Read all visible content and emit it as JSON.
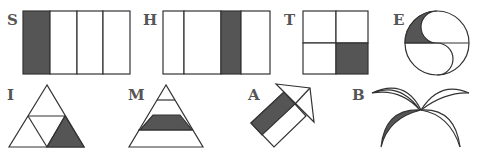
{
  "figures": [
    {
      "label": "S",
      "shape": "rectangle split into 4 vertical strips, first strip shaded"
    },
    {
      "label": "H",
      "shape": "rectangle split into 4 vertical strips, third strip shaded"
    },
    {
      "label": "T",
      "shape": "square split into 4 quarters, bottom-right shaded"
    },
    {
      "label": "E",
      "shape": "circle divided by S-curve and diameter, upper-left region shaded"
    },
    {
      "label": "I",
      "shape": "triangle divided into 4 small triangles, bottom-right shaded"
    },
    {
      "label": "M",
      "shape": "triangle divided into horizontal bands, third band shaded"
    },
    {
      "label": "A",
      "shape": "arrow shape with shaded band on shaft"
    },
    {
      "label": "B",
      "shape": "four leaves radiating from a point, lower-left leaf shaded"
    }
  ],
  "colors": {
    "shade": "#555555",
    "stroke": "#333333",
    "label": "#555555",
    "background": "#ffffff"
  }
}
